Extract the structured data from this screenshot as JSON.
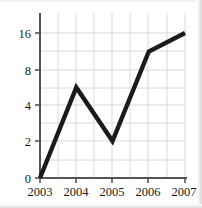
{
  "chart_data": {
    "type": "line",
    "title": "",
    "xlabel": "",
    "ylabel": "",
    "categories": [
      "2003",
      "2004",
      "2005",
      "2006",
      "2007"
    ],
    "x": [
      2003,
      2004,
      2005,
      2006,
      2007
    ],
    "values": [
      0,
      6,
      2,
      12,
      16
    ],
    "series": [
      {
        "name": "",
        "values": [
          0,
          6,
          2,
          12,
          16
        ]
      }
    ],
    "x_tick_labels": [
      "2003",
      "2004",
      "2005",
      "2006",
      "2007"
    ],
    "y_tick_labels": [
      "0",
      "2",
      "4",
      "8",
      "16"
    ],
    "y_tick_values": [
      0,
      2,
      4,
      8,
      16
    ],
    "xlim": [
      2003,
      2007
    ],
    "ylim": [
      0,
      16
    ],
    "y_scale": "doubling-equal-spaced",
    "grid": true,
    "minor_grid": true,
    "legend": "none",
    "line_color": "#1a1a1a",
    "line_width": 4,
    "grid_color": "#d6d6dc",
    "axis_color": "#5a5a5a",
    "plot_background": "#ffffff"
  },
  "labels": {
    "y": [
      {
        "text": "16",
        "value": 16
      },
      {
        "text": "8",
        "value": 8
      },
      {
        "text": "4",
        "value": 4
      },
      {
        "text": "2",
        "value": 2
      },
      {
        "text": "0",
        "value": 0
      }
    ],
    "x": [
      {
        "text": "2003"
      },
      {
        "text": "2004"
      },
      {
        "text": "2005"
      },
      {
        "text": "2006"
      },
      {
        "text": "2007"
      }
    ]
  }
}
